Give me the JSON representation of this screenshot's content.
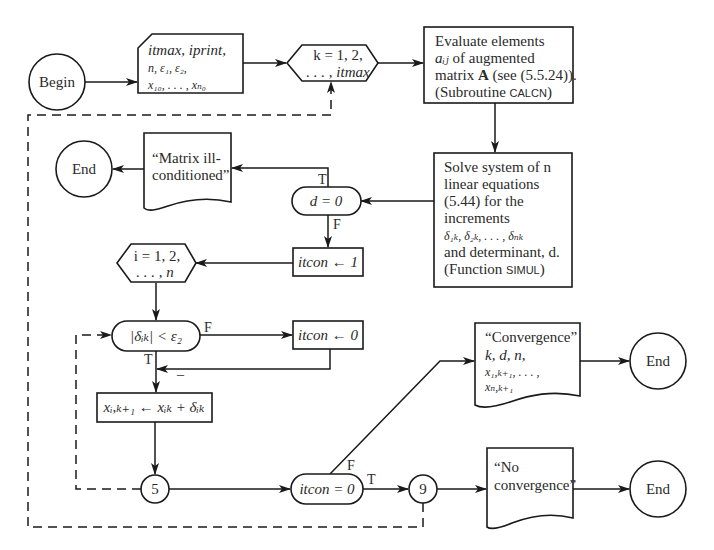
{
  "diagram": {
    "type": "flowchart",
    "nodes": {
      "begin": {
        "label": "Begin"
      },
      "input": {
        "line1": "itmax, iprint,",
        "line2": "n, ε₁, ε₂,",
        "line3": "x₁₀, . . . , xₙ₀"
      },
      "loop_k": {
        "line1": "k = 1, 2,",
        "line2": ". . . , itmax"
      },
      "evaluate": {
        "line1": "Evaluate elements",
        "line2_var": "aᵢⱼ",
        "line2_rest": " of augmented",
        "line3_pre": "matrix ",
        "line3_bold": "A",
        "line3_post": " (see (5.5.24)).",
        "line4_pre": "(Subroutine ",
        "line4_code": "CALCN",
        "line4_post": ")"
      },
      "solve": {
        "line1": "Solve system of n",
        "line2": "linear equations",
        "line3": "(5.44) for the",
        "line4": "increments",
        "line5": "δ₁ₖ, δ₂ₖ, . . . , δₙₖ",
        "line6": "and determinant, d.",
        "line7_pre": "(Function ",
        "line7_code": "SIMUL",
        "line7_post": ")"
      },
      "decision_d": {
        "label": "d = 0",
        "true_label": "T",
        "false_label": "F"
      },
      "matrix_ill": {
        "line1": "“Matrix ill-",
        "line2": "conditioned”"
      },
      "end_1": {
        "label": "End"
      },
      "itcon_1": {
        "label": "itcon ← 1"
      },
      "loop_i": {
        "line1": "i = 1, 2,",
        "line2": ". . . , n"
      },
      "decision_delta": {
        "label": "|δᵢₖ| < ε₂",
        "true_label": "T",
        "false_label": "F"
      },
      "itcon_0": {
        "label": "itcon ← 0"
      },
      "update_x": {
        "label": "xᵢ,ₖ₊₁ ← xᵢₖ + δᵢₖ"
      },
      "connector_5": {
        "label": "5"
      },
      "decision_itcon": {
        "label": "itcon = 0",
        "true_label": "T",
        "false_label": "F"
      },
      "connector_9": {
        "label": "9"
      },
      "convergence": {
        "line1": "“Convergence”",
        "line2": "k, d, n,",
        "line3": "x₁,ₖ₊₁, . . . ,",
        "line4": "xₙ,ₖ₊₁"
      },
      "end_2": {
        "label": "End"
      },
      "no_convergence": {
        "line1": "“No",
        "line2": "convergence”"
      },
      "end_3": {
        "label": "End"
      }
    },
    "minus_mark": "–"
  }
}
